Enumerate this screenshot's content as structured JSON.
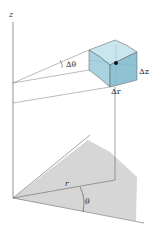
{
  "figure": {
    "labels": {
      "z_axis": "z",
      "delta_theta": "Δθ",
      "delta_z": "Δz",
      "delta_r": "Δr",
      "r": "r",
      "theta": "θ"
    },
    "colors": {
      "box_front": "#a9d3e0",
      "box_top": "#c9e6ee",
      "box_side": "#8fc3d4",
      "shaded_region": "#d6d6d6",
      "lines": "#555555",
      "point": "#111111"
    }
  }
}
